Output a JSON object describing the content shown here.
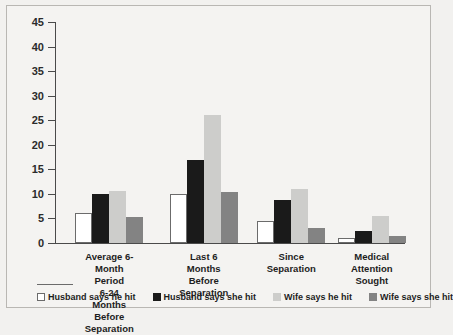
{
  "chart_data": {
    "type": "bar",
    "title": "",
    "xlabel": "",
    "ylabel": "",
    "ylim": [
      0,
      45
    ],
    "yticks": [
      45,
      40,
      35,
      30,
      25,
      20,
      15,
      10,
      5,
      0
    ],
    "grid": false,
    "legend_position": "bottom",
    "categories": [
      "Average 6-Month Period\n6-24 Months\nBefore Separation",
      "Last 6 Months\nBefore Separation",
      "Since\nSeparation",
      "Medical\nAttention Sought"
    ],
    "series": [
      {
        "name": "Husband says he hit",
        "color": "#ffffff",
        "values": [
          6.2,
          10.0,
          4.5,
          1.0
        ]
      },
      {
        "name": "Husband says she hit",
        "color": "#1a1a1a",
        "values": [
          9.9,
          17.0,
          8.8,
          2.4
        ]
      },
      {
        "name": "Wife says he hit",
        "color": "#cdcdcb",
        "values": [
          10.5,
          26.0,
          10.9,
          5.4
        ]
      },
      {
        "name": "Wife says she hit",
        "color": "#838383",
        "values": [
          5.2,
          10.4,
          3.0,
          1.5
        ]
      }
    ]
  },
  "footer": {
    "text": ""
  }
}
